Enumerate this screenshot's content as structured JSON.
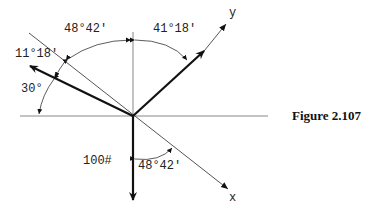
{
  "figure": {
    "caption": "Figure 2.107",
    "axes": {
      "x_label": "x",
      "y_label": "y"
    },
    "angles": {
      "top_left": "48°42'",
      "top_right": "41°18'",
      "upper_left": "11°18'",
      "left": "30°",
      "bottom": "48°42'"
    },
    "force_label": "100#",
    "colors": {
      "line": "#111111",
      "thin": "#555555",
      "text": "#222222"
    }
  }
}
